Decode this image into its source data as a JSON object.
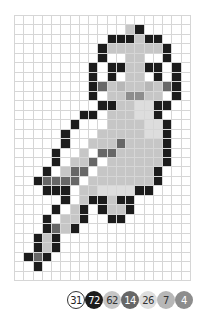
{
  "puzzle": {
    "cols": 19,
    "rows": 28,
    "grid_line_color": "#d6d6d6",
    "palette": {
      "W": {
        "color": "#ffffff",
        "count": "31",
        "text_color": "#222222",
        "border": "#333333"
      },
      "K": {
        "color": "#1c1c1c",
        "count": "72",
        "text_color": "#ffffff"
      },
      "L": {
        "color": "#c6c6c6",
        "count": "62",
        "text_color": "#333333"
      },
      "D": {
        "color": "#676767",
        "count": "14",
        "text_color": "#ffffff"
      },
      "V": {
        "color": "#dddddd",
        "count": "26",
        "text_color": "#333333"
      },
      "M": {
        "color": "#b7b7b7",
        "count": "7",
        "text_color": "#333333"
      },
      "G": {
        "color": "#8d8d8d",
        "count": "4",
        "text_color": "#ffffff"
      }
    },
    "legend_order": [
      "W",
      "K",
      "L",
      "D",
      "V",
      "M",
      "G"
    ],
    "cells": [
      "...................",
      "............LK.....",
      "..........KKKLKK...",
      ".........KLLLLLLK..",
      ".........KWWLLWWK..",
      "........KWKKLLKKWK.",
      "........KWKWLLWKWK.",
      "........KDLMLLMLDK.",
      "........KWLLGGLLWK.",
      ".........KKLLVVKK..",
      ".......KKWLLLVVK...",
      "......KWWWLLLLVVK..",
      ".....K...LLLLLVVK..",
      ".....K..LLLDLLLLK..",
      "....K..LWDDLLLLLK..",
      "....K.LLDWLLLLLLK..",
      "...K.LDDWLLLLLLK...",
      "..KDDDDWLLLLLLLK...",
      "...KKKWLLVVVVKK....",
      ".....KWLKKLKK......",
      "....K.LKWKLLK......",
      "...K.LLK..KK.......",
      "...KDLK............",
      "..KLK..............",
      "..KLK..............",
      ".KDK...............",
      "..K................",
      "..................."
    ]
  }
}
